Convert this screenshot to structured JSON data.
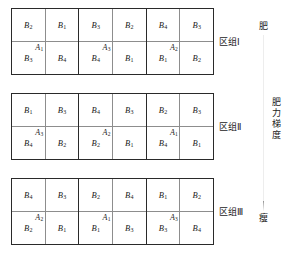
{
  "figure": {
    "type": "split-plot-field-layout",
    "blocks": [
      {
        "name": "区组Ⅰ",
        "main_plots": [
          {
            "label": "A",
            "sub": "1",
            "columns": [
              {
                "top": {
                  "label": "B",
                  "sub": "2"
                },
                "bottom": {
                  "label": "B",
                  "sub": "3"
                }
              },
              {
                "top": {
                  "label": "B",
                  "sub": "1"
                },
                "bottom": {
                  "label": "B",
                  "sub": "4"
                }
              }
            ]
          },
          {
            "label": "A",
            "sub": "3",
            "columns": [
              {
                "top": {
                  "label": "B",
                  "sub": "3"
                },
                "bottom": {
                  "label": "B",
                  "sub": "4"
                }
              },
              {
                "top": {
                  "label": "B",
                  "sub": "2"
                },
                "bottom": {
                  "label": "B",
                  "sub": "1"
                }
              }
            ]
          },
          {
            "label": "A",
            "sub": "2",
            "columns": [
              {
                "top": {
                  "label": "B",
                  "sub": "4"
                },
                "bottom": {
                  "label": "B",
                  "sub": "1"
                }
              },
              {
                "top": {
                  "label": "B",
                  "sub": "3"
                },
                "bottom": {
                  "label": "B",
                  "sub": "2"
                }
              }
            ]
          }
        ]
      },
      {
        "name": "区组Ⅱ",
        "main_plots": [
          {
            "label": "A",
            "sub": "3",
            "columns": [
              {
                "top": {
                  "label": "B",
                  "sub": "1"
                },
                "bottom": {
                  "label": "B",
                  "sub": "4"
                }
              },
              {
                "top": {
                  "label": "B",
                  "sub": "3"
                },
                "bottom": {
                  "label": "B",
                  "sub": "2"
                }
              }
            ]
          },
          {
            "label": "A",
            "sub": "2",
            "columns": [
              {
                "top": {
                  "label": "B",
                  "sub": "4"
                },
                "bottom": {
                  "label": "B",
                  "sub": "2"
                }
              },
              {
                "top": {
                  "label": "B",
                  "sub": "3"
                },
                "bottom": {
                  "label": "B",
                  "sub": "1"
                }
              }
            ]
          },
          {
            "label": "A",
            "sub": "1",
            "columns": [
              {
                "top": {
                  "label": "B",
                  "sub": "2"
                },
                "bottom": {
                  "label": "B",
                  "sub": "4"
                }
              },
              {
                "top": {
                  "label": "B",
                  "sub": "3"
                },
                "bottom": {
                  "label": "B",
                  "sub": "1"
                }
              }
            ]
          }
        ]
      },
      {
        "name": "区组Ⅲ",
        "main_plots": [
          {
            "label": "A",
            "sub": "2",
            "columns": [
              {
                "top": {
                  "label": "B",
                  "sub": "4"
                },
                "bottom": {
                  "label": "B",
                  "sub": "2"
                }
              },
              {
                "top": {
                  "label": "B",
                  "sub": "3"
                },
                "bottom": {
                  "label": "B",
                  "sub": "1"
                }
              }
            ]
          },
          {
            "label": "A",
            "sub": "1",
            "columns": [
              {
                "top": {
                  "label": "B",
                  "sub": "2"
                },
                "bottom": {
                  "label": "B",
                  "sub": "1"
                }
              },
              {
                "top": {
                  "label": "B",
                  "sub": "4"
                },
                "bottom": {
                  "label": "B",
                  "sub": "3"
                }
              }
            ]
          },
          {
            "label": "A",
            "sub": "3",
            "columns": [
              {
                "top": {
                  "label": "B",
                  "sub": "1"
                },
                "bottom": {
                  "label": "B",
                  "sub": "3"
                }
              },
              {
                "top": {
                  "label": "B",
                  "sub": "2"
                },
                "bottom": {
                  "label": "B",
                  "sub": "4"
                }
              }
            ]
          }
        ]
      }
    ],
    "gradient": {
      "top_label": "肥",
      "bottom_label": "瘦",
      "caption_chars": [
        "肥",
        "力",
        "梯",
        "度"
      ],
      "caption": "肥力梯度",
      "arrow_color": "#6e6e6e"
    },
    "colors": {
      "outer_border": "#2a2a2a",
      "inner_line": "#8d8d8d",
      "text": "#1a1a1a",
      "background": "#ffffff"
    }
  }
}
